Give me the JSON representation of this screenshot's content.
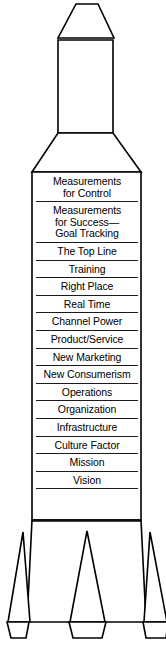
{
  "diagram": {
    "shape_name": "rocket",
    "colors": {
      "outline": "#000000",
      "fill": "#ffffff",
      "rule": "#1a1a1a"
    },
    "parts": {
      "nose_cone": "nose-cone",
      "upper_tube": "upper-tube",
      "shoulder": "shoulder-taper",
      "body": "main-body",
      "fin_left": "fin-left",
      "fin_center": "fin-center",
      "fin_right": "fin-right",
      "foot_left": "foot-left",
      "foot_center": "foot-center",
      "foot_right": "foot-right"
    },
    "stages": [
      {
        "label": "Measurements\nfor Control"
      },
      {
        "label": "Measurements\nfor Success—\nGoal Tracking"
      },
      {
        "label": "The Top Line"
      },
      {
        "label": "Training"
      },
      {
        "label": "Right Place"
      },
      {
        "label": "Real Time"
      },
      {
        "label": "Channel Power"
      },
      {
        "label": "Product/Service"
      },
      {
        "label": "New Marketing"
      },
      {
        "label": "New Consumerism"
      },
      {
        "label": "Operations"
      },
      {
        "label": "Organization"
      },
      {
        "label": "Infrastructure"
      },
      {
        "label": "Culture Factor"
      },
      {
        "label": "Mission"
      },
      {
        "label": "Vision"
      }
    ]
  }
}
